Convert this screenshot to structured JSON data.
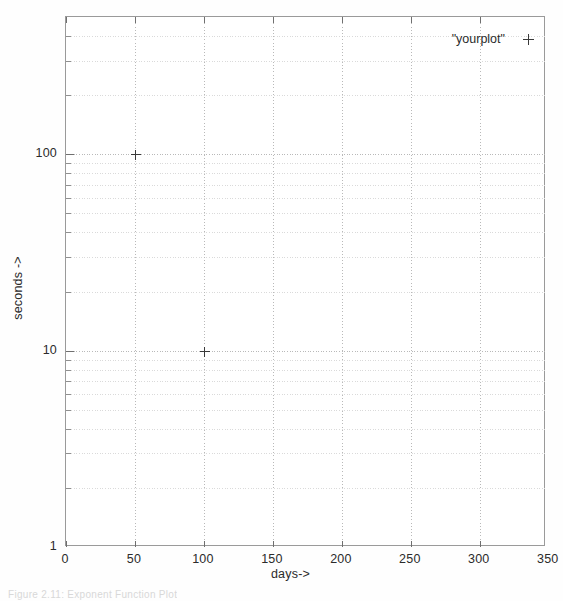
{
  "figure": {
    "caption": "Figure 2.11: Exponent Function Plot"
  },
  "legend": {
    "entry_label": "\"yourplot\"",
    "marker_glyph": "+"
  },
  "axes": {
    "x_title": "days->",
    "y_title": "seconds ->"
  },
  "chart_data": {
    "type": "scatter",
    "title": "",
    "subtitle": "",
    "xlabel": "days->",
    "ylabel": "seconds ->",
    "xscale": "linear",
    "yscale": "log",
    "xlim": [
      0,
      348
    ],
    "ylim": [
      1,
      500
    ],
    "grid": true,
    "grid_minor": true,
    "legend_position": "top-right-inside",
    "marker": "+",
    "marker_color": "#3a3a3a",
    "series": [
      {
        "name": "\"yourplot\"",
        "x": [
          50,
          100
        ],
        "y": [
          100,
          10
        ],
        "points": [
          {
            "x": 50,
            "y": 100
          },
          {
            "x": 100,
            "y": 10
          }
        ]
      }
    ],
    "x_ticks": [
      0,
      50,
      100,
      150,
      200,
      250,
      300,
      350
    ],
    "x_tick_labels": [
      "0",
      "50",
      "100",
      "150",
      "200",
      "250",
      "300",
      "350"
    ],
    "y_ticks": [
      1,
      10,
      100
    ],
    "y_tick_labels": [
      "1",
      "10",
      "100"
    ],
    "y_minor_ticks": [
      2,
      3,
      4,
      5,
      6,
      7,
      8,
      9,
      20,
      30,
      40,
      50,
      60,
      70,
      80,
      90,
      200,
      300,
      400
    ]
  },
  "colors": {
    "frame": "#9a9a9a",
    "major_grid": "#b9b9b9",
    "minor_grid": "#dadada",
    "text": "#2b2b2b",
    "marker": "#3a3a3a",
    "background": "#ffffff"
  }
}
